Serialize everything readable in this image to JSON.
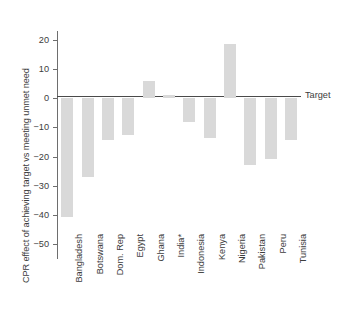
{
  "chart_data": {
    "type": "bar",
    "title": "",
    "subtitle": "",
    "xlabel": "",
    "ylabel": "CPR effect of achieving target vs meeting unmet need",
    "ylim": [
      -55,
      23
    ],
    "yticks": [
      20,
      10,
      0,
      -10,
      -20,
      -30,
      -40,
      -50
    ],
    "ytick_labels": [
      "20",
      "10",
      "0",
      "−10",
      "−20",
      "−30",
      "−40",
      "−50"
    ],
    "grid": false,
    "legend": "none",
    "bar_color": "#d9d9d9",
    "axis_color": "#6e6e6e",
    "zero_line_color": "#4a4a4a",
    "annotations": [
      {
        "text": "Target",
        "y": 0,
        "position": "right-of-zero-line"
      }
    ],
    "categories": [
      "Bangladesh",
      "Botswana",
      "Dom. Rep",
      "Egypt",
      "Ghana",
      "India*",
      "Indonesia",
      "Kenya",
      "Nigeria",
      "Pakistan",
      "Peru",
      "Tunisia"
    ],
    "values": [
      -40.8,
      -26.9,
      -14.2,
      -12.7,
      5.9,
      1.2,
      -8.0,
      -13.5,
      18.7,
      -23.0,
      -20.7,
      -14.2
    ]
  }
}
